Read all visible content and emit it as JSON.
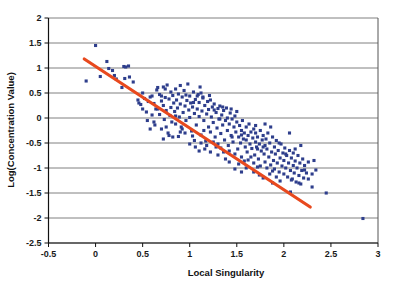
{
  "chart_data": {
    "type": "scatter",
    "title": "",
    "xlabel": "Local Singularity",
    "ylabel": "Log(Concentration Value)",
    "xlim": [
      -0.5,
      3
    ],
    "ylim": [
      -2.5,
      2
    ],
    "xticks": [
      -0.5,
      0,
      0.5,
      1,
      1.5,
      2,
      2.5,
      3
    ],
    "xtick_labels": [
      "-0.5",
      "0",
      "0.5",
      "1",
      "1.5",
      "2",
      "2.5",
      "3"
    ],
    "yticks": [
      -2.5,
      -2,
      -1.5,
      -1,
      -0.5,
      0,
      0.5,
      1,
      1.5,
      2
    ],
    "ytick_labels": [
      "-2.5",
      "-2",
      "-1.5",
      "-1",
      "-0.5",
      "0",
      "0.5",
      "1",
      "1.5",
      "2"
    ],
    "grid": {
      "horizontal": true,
      "vertical": false,
      "color": "#808080"
    },
    "legend": null,
    "marker": {
      "shape": "square",
      "color": "#2E3E8C",
      "size": 3.1
    },
    "trendline": {
      "type": "linear",
      "color": "#E8491E",
      "width": 3.2,
      "x_start": -0.12,
      "y_start": 1.18,
      "x_end": 2.28,
      "y_end": -1.78,
      "slope": -1.233,
      "intercept": 1.032
    },
    "series": [
      {
        "name": "data",
        "points": [
          [
            0.0,
            1.45
          ],
          [
            -0.1,
            0.74
          ],
          [
            0.05,
            0.83
          ],
          [
            0.12,
            1.13
          ],
          [
            0.14,
            0.99
          ],
          [
            0.18,
            0.95
          ],
          [
            0.2,
            0.85
          ],
          [
            0.22,
            0.78
          ],
          [
            0.3,
            1.03
          ],
          [
            0.32,
            1.02
          ],
          [
            0.31,
            0.79
          ],
          [
            0.28,
            0.61
          ],
          [
            0.35,
            1.04
          ],
          [
            0.36,
            0.82
          ],
          [
            0.4,
            0.72
          ],
          [
            0.45,
            0.36
          ],
          [
            0.46,
            0.3
          ],
          [
            0.48,
            0.27
          ],
          [
            0.5,
            0.18
          ],
          [
            0.5,
            0.5
          ],
          [
            0.52,
            0.39
          ],
          [
            0.54,
            0.12
          ],
          [
            0.55,
            -0.05
          ],
          [
            0.56,
            0.33
          ],
          [
            0.58,
            0.42
          ],
          [
            0.6,
            0.06
          ],
          [
            0.6,
            0.44
          ],
          [
            0.62,
            0.29
          ],
          [
            0.63,
            -0.14
          ],
          [
            0.64,
            0.18
          ],
          [
            0.65,
            0.56
          ],
          [
            0.66,
            0.61
          ],
          [
            0.68,
            0.47
          ],
          [
            0.68,
            0.07
          ],
          [
            0.7,
            0.34
          ],
          [
            0.7,
            -0.22
          ],
          [
            0.72,
            0.62
          ],
          [
            0.72,
            0.25
          ],
          [
            0.73,
            -0.03
          ],
          [
            0.74,
            0.41
          ],
          [
            0.75,
            0.15
          ],
          [
            0.76,
            0.66
          ],
          [
            0.77,
            -0.3
          ],
          [
            0.78,
            0.38
          ],
          [
            0.79,
            0.05
          ],
          [
            0.8,
            0.52
          ],
          [
            0.8,
            0.21
          ],
          [
            0.81,
            -0.08
          ],
          [
            0.82,
            0.45
          ],
          [
            0.83,
            0.3
          ],
          [
            0.84,
            0.13
          ],
          [
            0.85,
            0.58
          ],
          [
            0.85,
            -0.12
          ],
          [
            0.86,
            0.36
          ],
          [
            0.87,
            0.2
          ],
          [
            0.88,
            0.48
          ],
          [
            0.89,
            0.02
          ],
          [
            0.9,
            0.65
          ],
          [
            0.9,
            0.28
          ],
          [
            0.91,
            -0.18
          ],
          [
            0.92,
            0.42
          ],
          [
            0.93,
            0.11
          ],
          [
            0.94,
            0.55
          ],
          [
            0.95,
            0.24
          ],
          [
            0.96,
            -0.05
          ],
          [
            0.97,
            0.35
          ],
          [
            0.98,
            0.68
          ],
          [
            0.99,
            0.16
          ],
          [
            1.0,
            0.44
          ],
          [
            1.0,
            0.01
          ],
          [
            1.01,
            0.3
          ],
          [
            1.02,
            -0.26
          ],
          [
            1.03,
            0.22
          ],
          [
            1.04,
            0.52
          ],
          [
            1.05,
            0.09
          ],
          [
            1.06,
            0.37
          ],
          [
            1.07,
            -0.14
          ],
          [
            1.08,
            0.18
          ],
          [
            1.09,
            0.47
          ],
          [
            1.1,
            0.03
          ],
          [
            1.1,
            0.31
          ],
          [
            1.11,
            0.62
          ],
          [
            1.12,
            -0.34
          ],
          [
            1.13,
            0.14
          ],
          [
            1.14,
            0.4
          ],
          [
            1.15,
            -0.05
          ],
          [
            1.16,
            0.25
          ],
          [
            1.17,
            -0.46
          ],
          [
            1.18,
            0.08
          ],
          [
            1.19,
            0.33
          ],
          [
            1.2,
            -0.18
          ],
          [
            1.2,
            0.17
          ],
          [
            1.21,
            0.45
          ],
          [
            1.22,
            -0.28
          ],
          [
            1.23,
            0.02
          ],
          [
            1.24,
            0.22
          ],
          [
            1.25,
            -0.09
          ],
          [
            1.26,
            0.28
          ],
          [
            1.27,
            -0.38
          ],
          [
            1.28,
            0.11
          ],
          [
            1.29,
            -0.2
          ],
          [
            1.3,
            0.19
          ],
          [
            1.3,
            -0.52
          ],
          [
            1.31,
            -0.02
          ],
          [
            1.32,
            0.24
          ],
          [
            1.33,
            -0.31
          ],
          [
            1.34,
            0.06
          ],
          [
            1.35,
            -0.14
          ],
          [
            1.36,
            0.15
          ],
          [
            1.37,
            -0.44
          ],
          [
            1.38,
            -0.05
          ],
          [
            1.39,
            0.2
          ],
          [
            1.4,
            -0.25
          ],
          [
            1.4,
            0.0
          ],
          [
            1.41,
            -0.55
          ],
          [
            1.42,
            -0.12
          ],
          [
            1.43,
            0.1
          ],
          [
            1.44,
            -0.35
          ],
          [
            1.45,
            -0.02
          ],
          [
            1.46,
            -0.48
          ],
          [
            1.47,
            -0.18
          ],
          [
            1.48,
            0.04
          ],
          [
            1.49,
            -0.28
          ],
          [
            1.5,
            -0.08
          ],
          [
            1.5,
            0.13
          ],
          [
            1.51,
            -0.62
          ],
          [
            1.52,
            -0.38
          ],
          [
            1.53,
            -0.15
          ],
          [
            1.54,
            -0.5
          ],
          [
            1.55,
            -0.25
          ],
          [
            1.56,
            -0.05
          ],
          [
            1.57,
            -0.42
          ],
          [
            1.58,
            -0.3
          ],
          [
            1.59,
            -0.58
          ],
          [
            1.6,
            -0.18
          ],
          [
            1.6,
            -0.44
          ],
          [
            1.61,
            -0.68
          ],
          [
            1.62,
            -0.35
          ],
          [
            1.63,
            -0.12
          ],
          [
            1.64,
            -0.52
          ],
          [
            1.65,
            -0.28
          ],
          [
            1.66,
            -0.61
          ],
          [
            1.67,
            -0.4
          ],
          [
            1.68,
            -0.22
          ],
          [
            1.69,
            -0.74
          ],
          [
            1.7,
            -0.48
          ],
          [
            1.7,
            -0.3
          ],
          [
            1.71,
            -0.58
          ],
          [
            1.72,
            -0.38
          ],
          [
            1.73,
            -0.82
          ],
          [
            1.74,
            -0.52
          ],
          [
            1.75,
            -0.25
          ],
          [
            1.76,
            -0.66
          ],
          [
            1.77,
            -0.44
          ],
          [
            1.78,
            -0.35
          ],
          [
            1.79,
            -0.72
          ],
          [
            1.8,
            -0.55
          ],
          [
            1.8,
            -0.88
          ],
          [
            1.81,
            -0.42
          ],
          [
            1.82,
            -0.62
          ],
          [
            1.83,
            -0.3
          ],
          [
            1.84,
            -0.78
          ],
          [
            1.85,
            -0.5
          ],
          [
            1.86,
            -0.94
          ],
          [
            1.87,
            -0.68
          ],
          [
            1.88,
            -0.38
          ],
          [
            1.89,
            -0.85
          ],
          [
            1.9,
            -0.58
          ],
          [
            1.9,
            -1.02
          ],
          [
            1.91,
            -0.72
          ],
          [
            1.92,
            -0.45
          ],
          [
            1.93,
            -0.9
          ],
          [
            1.94,
            -0.65
          ],
          [
            1.95,
            -1.08
          ],
          [
            1.96,
            -0.8
          ],
          [
            1.97,
            -0.52
          ],
          [
            1.98,
            -0.96
          ],
          [
            1.99,
            -0.7
          ],
          [
            2.0,
            -1.12
          ],
          [
            2.0,
            -0.85
          ],
          [
            2.01,
            -0.6
          ],
          [
            2.02,
            -1.0
          ],
          [
            2.03,
            -0.75
          ],
          [
            2.04,
            -1.18
          ],
          [
            2.05,
            -0.9
          ],
          [
            2.06,
            -0.65
          ],
          [
            2.07,
            -1.05
          ],
          [
            2.08,
            -0.8
          ],
          [
            2.09,
            -1.22
          ],
          [
            2.1,
            -0.95
          ],
          [
            2.1,
            -0.7
          ],
          [
            2.11,
            -1.1
          ],
          [
            2.12,
            -0.86
          ],
          [
            2.13,
            -1.28
          ],
          [
            2.14,
            -1.0
          ],
          [
            2.15,
            -0.75
          ],
          [
            2.16,
            -1.15
          ],
          [
            2.17,
            -0.9
          ],
          [
            2.18,
            -1.32
          ],
          [
            2.19,
            -1.05
          ],
          [
            2.2,
            -0.82
          ],
          [
            2.21,
            -1.2
          ],
          [
            2.22,
            -0.95
          ],
          [
            2.24,
            -1.1
          ],
          [
            2.26,
            -0.88
          ],
          [
            2.3,
            -1.38
          ],
          [
            2.32,
            -0.85
          ],
          [
            2.34,
            -1.04
          ],
          [
            2.45,
            -1.5
          ],
          [
            2.07,
            -1.48
          ],
          [
            2.84,
            -2.01
          ],
          [
            0.72,
            -0.42
          ],
          [
            0.78,
            -0.35
          ],
          [
            0.88,
            -0.37
          ],
          [
            0.95,
            -0.3
          ],
          [
            1.05,
            -0.45
          ],
          [
            1.12,
            -0.5
          ],
          [
            1.18,
            -0.55
          ],
          [
            1.25,
            -0.48
          ],
          [
            1.33,
            -0.6
          ],
          [
            1.42,
            -0.66
          ],
          [
            1.48,
            -0.72
          ],
          [
            1.55,
            -0.78
          ],
          [
            1.62,
            -0.84
          ],
          [
            1.68,
            -0.9
          ],
          [
            1.75,
            -0.96
          ],
          [
            1.82,
            -1.0
          ],
          [
            1.88,
            -1.06
          ],
          [
            1.95,
            -0.5
          ],
          [
            1.52,
            -0.92
          ],
          [
            1.58,
            -0.86
          ],
          [
            0.85,
            0.04
          ],
          [
            0.92,
            -0.22
          ],
          [
            1.03,
            -0.36
          ],
          [
            1.15,
            -0.25
          ],
          [
            1.28,
            -0.58
          ],
          [
            1.36,
            -0.68
          ],
          [
            1.45,
            -0.38
          ],
          [
            1.55,
            -0.34
          ],
          [
            1.65,
            -0.78
          ],
          [
            1.72,
            -0.62
          ],
          [
            1.78,
            -0.58
          ],
          [
            1.85,
            -1.12
          ],
          [
            1.92,
            -1.18
          ],
          [
            2.02,
            -0.72
          ],
          [
            2.12,
            -0.62
          ],
          [
            2.22,
            -1.04
          ],
          [
            1.08,
            0.44
          ],
          [
            1.14,
            0.42
          ],
          [
            1.22,
            0.36
          ],
          [
            1.12,
            0.5
          ],
          [
            1.04,
            0.31
          ],
          [
            0.96,
            0.46
          ],
          [
            1.35,
            0.22
          ],
          [
            1.44,
            0.18
          ],
          [
            1.26,
            0.16
          ],
          [
            1.32,
            -0.02
          ],
          [
            0.66,
            0.18
          ],
          [
            0.58,
            -0.22
          ],
          [
            0.75,
            -0.18
          ],
          [
            0.82,
            -0.38
          ],
          [
            0.7,
            0.44
          ],
          [
            0.74,
            0.58
          ],
          [
            1.6,
            -1.0
          ],
          [
            1.68,
            -1.08
          ],
          [
            1.74,
            -1.14
          ],
          [
            1.8,
            -0.12
          ],
          [
            1.86,
            -0.18
          ],
          [
            1.7,
            -0.15
          ],
          [
            2.06,
            -0.3
          ],
          [
            2.18,
            -0.55
          ],
          [
            1.48,
            -1.02
          ],
          [
            1.55,
            -1.08
          ],
          [
            1.42,
            -0.88
          ],
          [
            1.38,
            -0.82
          ],
          [
            1.3,
            -0.74
          ],
          [
            1.22,
            -0.68
          ],
          [
            1.16,
            -0.62
          ],
          [
            1.1,
            -0.66
          ],
          [
            0.9,
            -0.28
          ],
          [
            1.0,
            -0.52
          ],
          [
            1.06,
            -0.58
          ],
          [
            0.62,
            -0.08
          ],
          [
            2.26,
            -1.22
          ],
          [
            2.3,
            -1.12
          ],
          [
            2.16,
            -1.3
          ],
          [
            2.08,
            -1.24
          ],
          [
            1.96,
            -1.26
          ],
          [
            1.88,
            -1.3
          ],
          [
            1.78,
            -1.2
          ],
          [
            1.72,
            -0.98
          ]
        ]
      }
    ]
  }
}
